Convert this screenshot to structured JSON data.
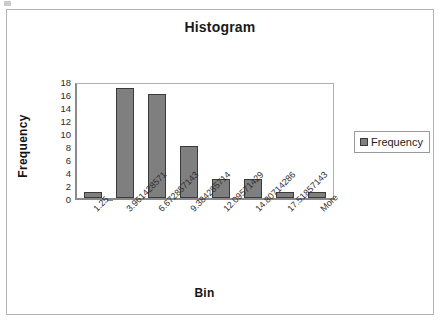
{
  "chart_data": {
    "type": "bar",
    "title": "Histogram",
    "xlabel": "Bin",
    "ylabel": "Frequency",
    "categories": [
      "1.25",
      "3.961428571",
      "6.672857143",
      "9.384285714",
      "12.09571429",
      "14.80714286",
      "17.51857143",
      "More"
    ],
    "values": [
      1,
      17,
      16,
      8,
      3,
      3,
      1,
      1
    ],
    "series": [
      {
        "name": "Frequency",
        "values": [
          1,
          17,
          16,
          8,
          3,
          3,
          1,
          1
        ]
      }
    ],
    "ylim": [
      0,
      18
    ],
    "ytick_step": 2,
    "yticks": [
      0,
      2,
      4,
      6,
      8,
      10,
      12,
      14,
      16,
      18
    ],
    "grid": false,
    "legend_position": "right",
    "bar_color": "#7f7f7f",
    "bar_border_color": "#3a3a3a"
  },
  "legend": {
    "entries": [
      {
        "label": "Frequency",
        "color": "#7f7f7f"
      }
    ]
  }
}
